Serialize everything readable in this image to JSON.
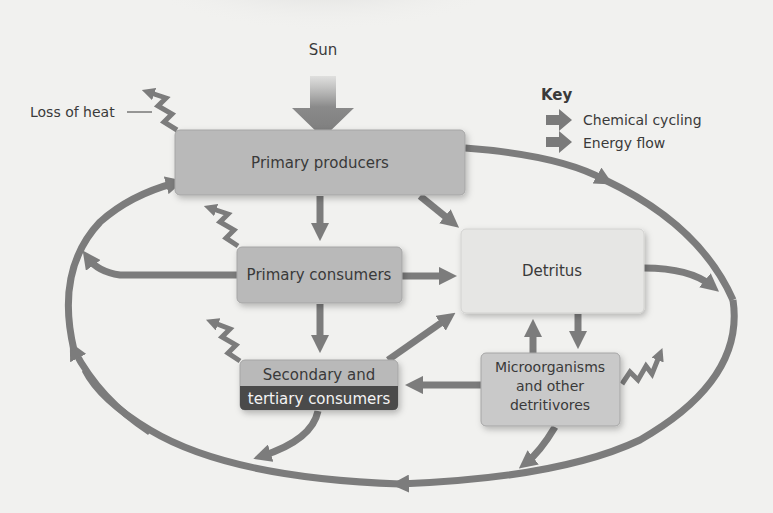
{
  "diagram": {
    "type": "ecosystem energy flow and chemical cycling",
    "sun_label": "Sun",
    "loss_of_heat_label": "Loss of heat",
    "key": {
      "title": "Key",
      "items": [
        {
          "label": "Chemical cycling",
          "color": "#7a7a7a"
        },
        {
          "label": "Energy flow",
          "color": "#7a7a7a"
        }
      ]
    },
    "nodes": {
      "primary_producers": "Primary producers",
      "primary_consumers": "Primary consumers",
      "detritus": "Detritus",
      "secondary_line1": "Secondary and",
      "secondary_line2": "tertiary consumers",
      "micro_line1": "Microorganisms",
      "micro_line2": "and other",
      "micro_line3": "detritivores"
    },
    "colors": {
      "background": "#f1f1ef",
      "arrow": "#7c7c7c",
      "box_dark": "#b9b9b9",
      "box_light": "#e6e6e4",
      "box_band_dark": "#4a4a4a",
      "text": "#3a3a3a"
    }
  }
}
